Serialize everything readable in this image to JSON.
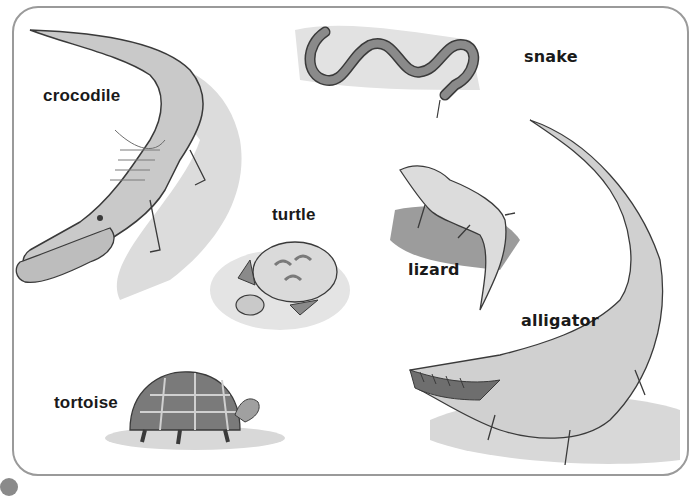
{
  "image": {
    "description": "Illustrated worksheet of reptiles with labels",
    "colors": {
      "line": "#3a3a3a",
      "body": "#c9c9c9",
      "shadow": "#d8d8d8",
      "dark": "#6e6e6e",
      "frame": "#9a9a9a"
    }
  },
  "labels": {
    "crocodile": "crocodile",
    "snake": "snake",
    "turtle": "turtle",
    "lizard": "lizard",
    "alligator": "alligator",
    "tortoise": "tortoise"
  },
  "animals": [
    {
      "name": "crocodile"
    },
    {
      "name": "snake"
    },
    {
      "name": "turtle"
    },
    {
      "name": "lizard"
    },
    {
      "name": "alligator"
    },
    {
      "name": "tortoise"
    }
  ]
}
